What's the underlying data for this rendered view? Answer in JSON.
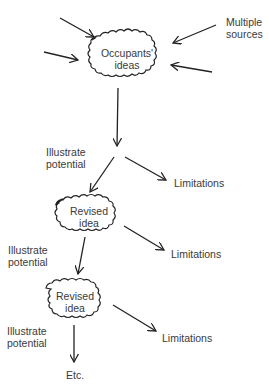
{
  "diagram": {
    "colors": {
      "stroke": "#222222",
      "text": "#3a3a3a",
      "background": "#ffffff"
    },
    "nodes": {
      "top": {
        "line1": "Occupants'",
        "line2": "ideas",
        "shape": "cloud"
      },
      "revised1": {
        "line1": "Revised",
        "line2": "idea",
        "shape": "cloud"
      },
      "revised2": {
        "line1": "Revised",
        "line2": "idea",
        "shape": "cloud"
      }
    },
    "labels": {
      "multiple_sources": {
        "line1": "Multiple",
        "line2": "sources"
      },
      "illustrate1": {
        "line1": "Illustrate",
        "line2": "potential"
      },
      "illustrate2": {
        "line1": "Illustrate",
        "line2": "potential"
      },
      "illustrate3": {
        "line1": "Illustrate",
        "line2": "potential"
      },
      "limitations1": "Limitations",
      "limitations2": "Limitations",
      "limitations3": "Limitations",
      "etc": "Etc."
    },
    "edges": [
      {
        "from": "source-1",
        "to": "top"
      },
      {
        "from": "source-2",
        "to": "top"
      },
      {
        "from": "source-3",
        "to": "top"
      },
      {
        "from": "source-4",
        "to": "top"
      },
      {
        "from": "top",
        "to": "split-1",
        "label": "Illustrate potential"
      },
      {
        "from": "split-1",
        "to": "revised1"
      },
      {
        "from": "split-1",
        "to": "limitations1"
      },
      {
        "from": "revised1",
        "to": "revised2",
        "label": "Illustrate potential"
      },
      {
        "from": "revised1",
        "to": "limitations2"
      },
      {
        "from": "revised2",
        "to": "etc",
        "label": "Illustrate potential"
      },
      {
        "from": "revised2",
        "to": "limitations3"
      }
    ]
  }
}
